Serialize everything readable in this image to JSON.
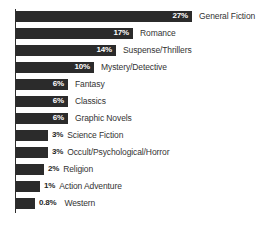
{
  "chart_data": {
    "type": "bar",
    "orientation": "horizontal",
    "title": "",
    "subtitle": "",
    "xlabel": "",
    "ylabel": "",
    "grid": false,
    "legend": false,
    "legend_position": "none",
    "axis_line": "left-vertical",
    "value_suffix": "%",
    "bar_color": "#2b2b2b",
    "background_color": "#ffffff",
    "inside_label_color": "#ffffff",
    "outside_label_color": "#262626",
    "category_label_color": "#333333",
    "xlim": [
      0,
      27
    ],
    "categories": [
      "General Fiction",
      "Romance",
      "Suspense/Thrillers",
      "Mystery/Detective",
      "Fantasy",
      "Classics",
      "Graphic Novels",
      "Science Fiction",
      "Occult/Psychological/Horror",
      "Religion",
      "Action Adventure",
      "Western"
    ],
    "values": [
      27,
      17,
      14,
      10,
      6,
      6,
      6,
      3,
      3,
      2,
      1,
      0.8
    ],
    "value_labels": [
      "27%",
      "17%",
      "14%",
      "10%",
      "6%",
      "6%",
      "6%",
      "3%",
      "3%",
      "2%",
      "1%",
      "0.8%"
    ],
    "bars": [
      {
        "category": "General Fiction",
        "value": 27,
        "value_label": "27%",
        "bar_px": 176,
        "label_placement": "inside"
      },
      {
        "category": "Romance",
        "value": 17,
        "value_label": "17%",
        "bar_px": 117,
        "label_placement": "inside"
      },
      {
        "category": "Suspense/Thrillers",
        "value": 14,
        "value_label": "14%",
        "bar_px": 100,
        "label_placement": "inside"
      },
      {
        "category": "Mystery/Detective",
        "value": 10,
        "value_label": "10%",
        "bar_px": 78,
        "label_placement": "inside"
      },
      {
        "category": "Fantasy",
        "value": 6,
        "value_label": "6%",
        "bar_px": 52,
        "label_placement": "inside"
      },
      {
        "category": "Classics",
        "value": 6,
        "value_label": "6%",
        "bar_px": 52,
        "label_placement": "inside"
      },
      {
        "category": "Graphic Novels",
        "value": 6,
        "value_label": "6%",
        "bar_px": 52,
        "label_placement": "inside"
      },
      {
        "category": "Science Fiction",
        "value": 3,
        "value_label": "3%",
        "bar_px": 32,
        "label_placement": "outside"
      },
      {
        "category": "Occult/Psychological/Horror",
        "value": 3,
        "value_label": "3%",
        "bar_px": 32,
        "label_placement": "outside"
      },
      {
        "category": "Religion",
        "value": 2,
        "value_label": "2%",
        "bar_px": 28,
        "label_placement": "outside"
      },
      {
        "category": "Action Adventure",
        "value": 1,
        "value_label": "1%",
        "bar_px": 24,
        "label_placement": "outside"
      },
      {
        "category": "Western",
        "value": 0.8,
        "value_label": "0.8%",
        "bar_px": 19,
        "label_placement": "outside"
      }
    ]
  }
}
